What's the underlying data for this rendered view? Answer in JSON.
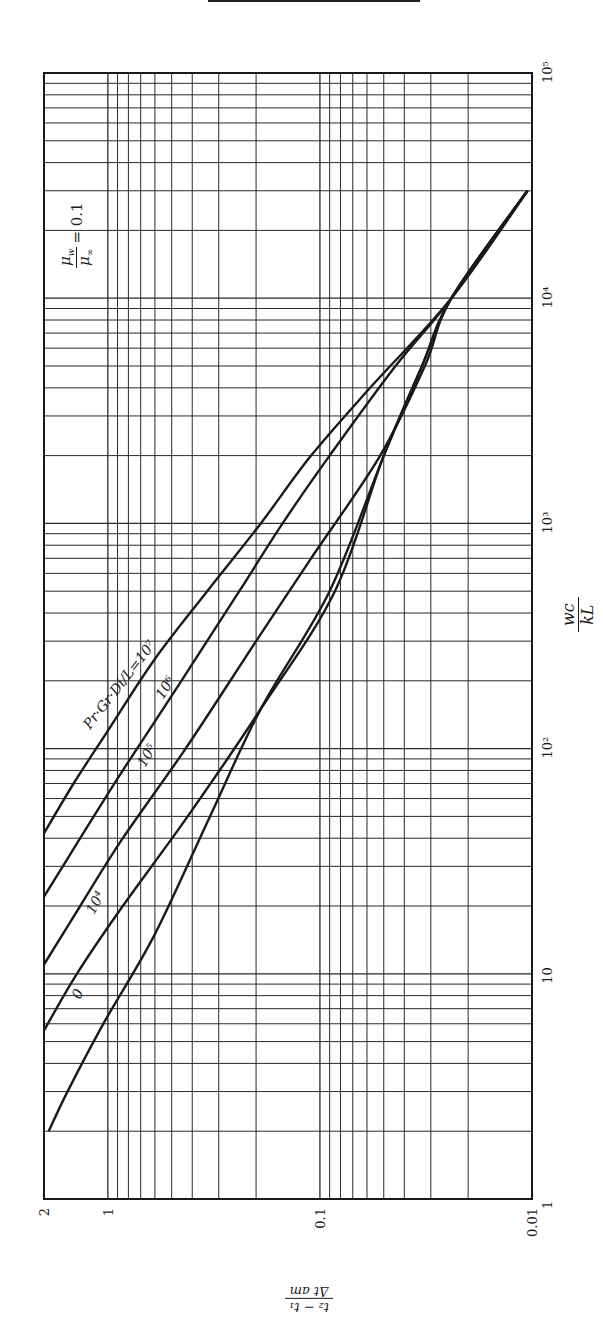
{
  "chart_data": {
    "type": "line",
    "orientation_note": "figure printed rotated 90 degrees counter-clockwise",
    "title": "",
    "parameter_annotation": "μw/μ∞ = 0.1",
    "family_label": "Pr·Gr·Di/L",
    "xlabel": "wc/kL",
    "ylabel": "(t2 − t1)/Δt_am",
    "xscale": "log",
    "yscale": "log",
    "xlim": [
      1,
      100000
    ],
    "ylim": [
      0.01,
      2
    ],
    "x_ticks": [
      "1",
      "10",
      "10²",
      "10³",
      "10⁴",
      "10⁵"
    ],
    "y_ticks": [
      "2",
      "1",
      "0.1",
      "0.01"
    ],
    "grid": true,
    "legend": "inline curve labels",
    "series": [
      {
        "name": "Pr·Gr·Di/L = 10⁷",
        "label": "Pr·Gr·Di/L=10⁷",
        "points": [
          [
            42,
            2.0
          ],
          [
            70,
            1.45
          ],
          [
            120,
            1.0
          ],
          [
            250,
            0.6
          ],
          [
            500,
            0.34
          ],
          [
            1000,
            0.19
          ],
          [
            2000,
            0.11
          ],
          [
            4000,
            0.058
          ],
          [
            10000,
            0.024
          ],
          [
            30000,
            0.0105
          ]
        ]
      },
      {
        "name": "10⁶",
        "label": "10⁶",
        "points": [
          [
            22,
            2.0
          ],
          [
            40,
            1.35
          ],
          [
            80,
            0.85
          ],
          [
            200,
            0.45
          ],
          [
            500,
            0.24
          ],
          [
            1000,
            0.15
          ],
          [
            2000,
            0.09
          ],
          [
            5000,
            0.044
          ],
          [
            10000,
            0.024
          ],
          [
            30000,
            0.0105
          ]
        ]
      },
      {
        "name": "10⁵",
        "label": "10⁵",
        "points": [
          [
            11,
            2.0
          ],
          [
            20,
            1.35
          ],
          [
            40,
            0.85
          ],
          [
            100,
            0.43
          ],
          [
            300,
            0.2
          ],
          [
            700,
            0.11
          ],
          [
            2000,
            0.052
          ],
          [
            5000,
            0.032
          ],
          [
            10000,
            0.024
          ],
          [
            30000,
            0.0105
          ]
        ]
      },
      {
        "name": "10⁴",
        "label": "10⁴",
        "points": [
          [
            5.6,
            2.0
          ],
          [
            10,
            1.4
          ],
          [
            20,
            0.85
          ],
          [
            50,
            0.42
          ],
          [
            150,
            0.19
          ],
          [
            500,
            0.085
          ],
          [
            2000,
            0.05
          ],
          [
            5000,
            0.033
          ],
          [
            10000,
            0.024
          ],
          [
            30000,
            0.0105
          ]
        ]
      },
      {
        "name": "0",
        "label": "0",
        "points": [
          [
            2.0,
            1.9
          ],
          [
            3,
            1.55
          ],
          [
            6,
            1.05
          ],
          [
            15,
            0.6
          ],
          [
            50,
            0.33
          ],
          [
            150,
            0.19
          ],
          [
            500,
            0.09
          ],
          [
            2000,
            0.05
          ],
          [
            5000,
            0.033
          ],
          [
            10000,
            0.024
          ],
          [
            30000,
            0.0105
          ]
        ]
      }
    ]
  },
  "labels": {
    "param_lhs_num": "μ",
    "param_lhs_num_sub": "w",
    "param_lhs_den": "μ",
    "param_lhs_den_sub": "∞",
    "param_rhs": "= 0.1",
    "xlabel_num": "wc",
    "xlabel_den": "kL",
    "ylabel_num": "t₂ − t₁",
    "ylabel_den": "Δt am"
  },
  "colors": {
    "ink": "#1a1a1a",
    "grid": "#2a2a2a",
    "background": "#ffffff"
  }
}
